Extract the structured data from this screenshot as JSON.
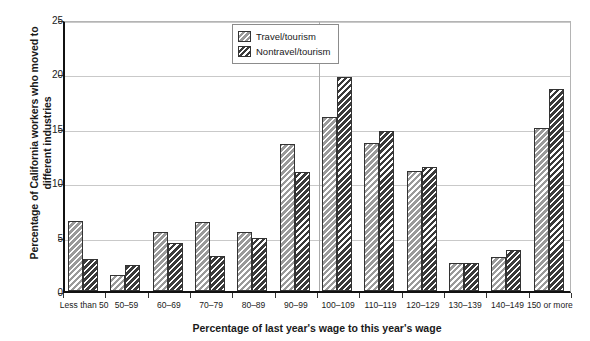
{
  "chart_data": {
    "type": "bar",
    "title": "",
    "xlabel": "Percentage of last year's wage to this year's wage",
    "ylabel": "Percentage of California workers who moved to different industries",
    "categories": [
      "Less than 50",
      "50–59",
      "60–69",
      "70–79",
      "80–89",
      "90–99",
      "100–109",
      "110–119",
      "120–129",
      "130–139",
      "140–149",
      "150 or more"
    ],
    "series": [
      {
        "name": "Travel/tourism",
        "color": "#9a9a9a",
        "values": [
          6.4,
          1.5,
          5.4,
          6.3,
          5.4,
          13.5,
          16.0,
          13.6,
          11.0,
          2.6,
          3.1,
          15.0
        ]
      },
      {
        "name": "Nontravel/tourism",
        "color": "#3b3b3b",
        "values": [
          2.9,
          2.4,
          4.4,
          3.2,
          4.9,
          10.9,
          19.7,
          14.7,
          11.4,
          2.6,
          3.8,
          18.6
        ]
      }
    ],
    "ylim": [
      0,
      25
    ],
    "yticks": [
      0,
      5,
      10,
      15,
      20,
      25
    ],
    "ytick_labels": [
      "0",
      "5",
      "10",
      "15",
      "20",
      "25"
    ],
    "grid": true,
    "grid_axis": "y",
    "legend_position": "top-center",
    "reference_line_category": "100–109"
  },
  "legend": {
    "items": [
      {
        "label": "Travel/tourism"
      },
      {
        "label": "Nontravel/tourism"
      }
    ]
  }
}
